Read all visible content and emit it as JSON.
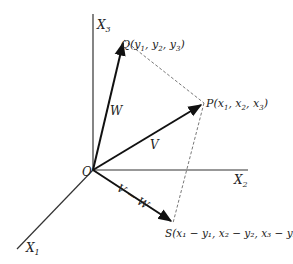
{
  "diagram": {
    "axes": {
      "x1": {
        "label": "X",
        "sub": "1"
      },
      "x2": {
        "label": "X",
        "sub": "2"
      },
      "x3": {
        "label": "X",
        "sub": "3"
      }
    },
    "origin": {
      "label": "O"
    },
    "points": {
      "Q": {
        "name": "Q",
        "coords": "(y",
        "c1": "1",
        "c2": "2",
        "c3": "3"
      },
      "P": {
        "name": "P",
        "coords": "(x",
        "c1": "1",
        "c2": "2",
        "c3": "3"
      },
      "S": {
        "name": "S",
        "label": "S(x₁ − y₁, x₂ − y₂, x₃ − y₃)"
      }
    },
    "vectors": {
      "W": {
        "label": "W"
      },
      "V": {
        "label": "V"
      },
      "V_minus_W": {
        "label": "V − W"
      }
    },
    "colors": {
      "axis": "#333333",
      "vector": "#111111",
      "dashed": "#555555",
      "background": "#ffffff"
    }
  }
}
